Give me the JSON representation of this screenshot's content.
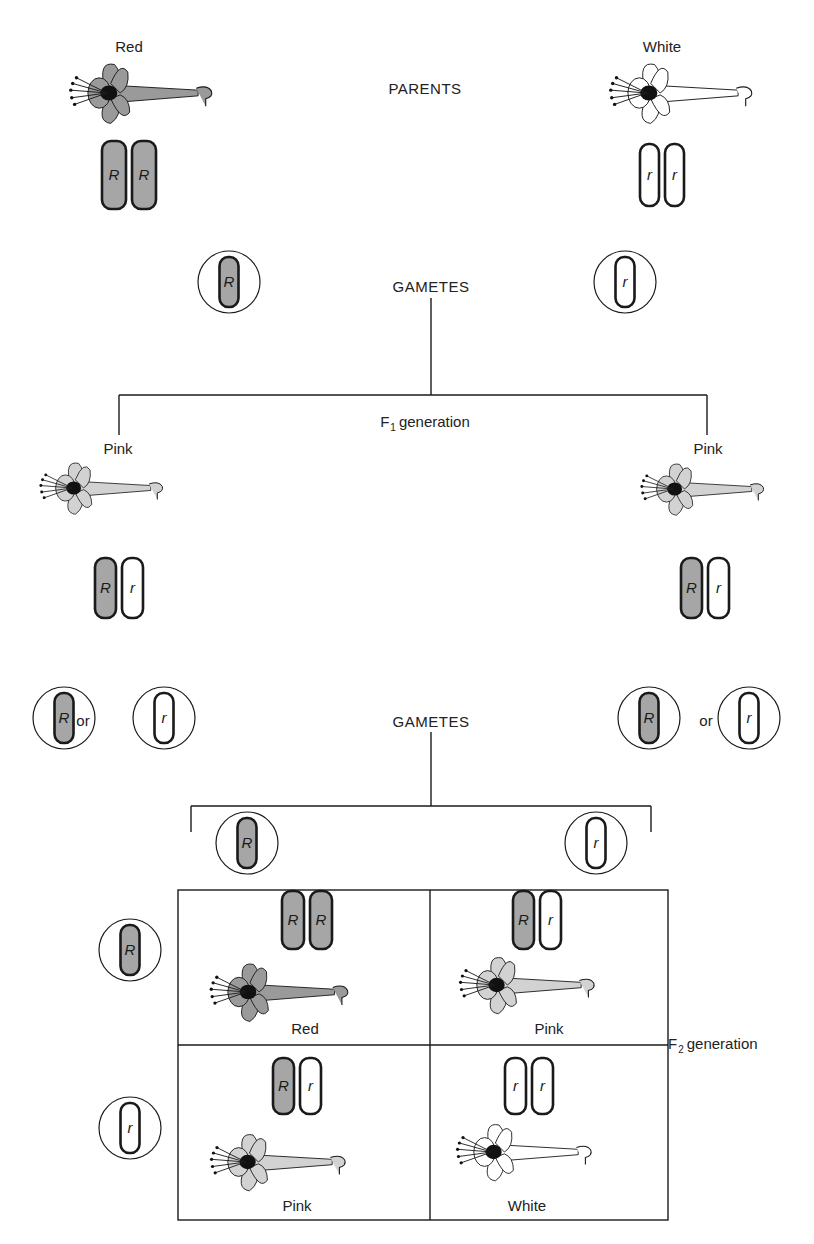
{
  "diagram": {
    "colors": {
      "red_fill": "#8f8f8f",
      "pink_fill": "#c8c8c8",
      "white_fill": "#ffffff",
      "dominant_chromosome_fill": "#a6a6a6",
      "line": "#1a1a1a"
    },
    "parents": {
      "stage_label": "PARENTS",
      "left": {
        "phenotype": "Red",
        "genotype": [
          "R",
          "R"
        ]
      },
      "right": {
        "phenotype": "White",
        "genotype": [
          "r",
          "r"
        ]
      }
    },
    "parent_gametes": {
      "stage_label": "GAMETES",
      "left": {
        "allele": "R"
      },
      "right": {
        "allele": "r"
      }
    },
    "f1": {
      "label_main": "F",
      "label_sub": "1",
      "label_rest": "generation",
      "left": {
        "phenotype": "Pink",
        "genotype": [
          "R",
          "r"
        ]
      },
      "right": {
        "phenotype": "Pink",
        "genotype": [
          "R",
          "r"
        ]
      }
    },
    "f1_gametes": {
      "stage_label": "GAMETES",
      "connector": "or",
      "left": [
        "R",
        "r"
      ],
      "right": [
        "R",
        "r"
      ]
    },
    "punnett": {
      "column_gametes": [
        "R",
        "r"
      ],
      "row_gametes": [
        "R",
        "r"
      ],
      "label_main": "F",
      "label_sub": "2",
      "label_rest": "generation",
      "cells": [
        {
          "genotype": [
            "R",
            "R"
          ],
          "phenotype": "Red"
        },
        {
          "genotype": [
            "R",
            "r"
          ],
          "phenotype": "Pink"
        },
        {
          "genotype": [
            "R",
            "r"
          ],
          "phenotype": "Pink"
        },
        {
          "genotype": [
            "r",
            "r"
          ],
          "phenotype": "White"
        }
      ]
    }
  }
}
